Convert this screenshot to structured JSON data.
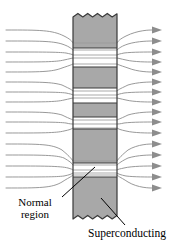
{
  "figure": {
    "canvas": {
      "width": 186,
      "height": 244,
      "background": "#ffffff"
    },
    "bar": {
      "name": "superconducting-bar",
      "x": 73,
      "width": 44,
      "top": 13,
      "bottom": 219,
      "fill_color": "#a8a8a8",
      "stroke_color": "#3a3a3a",
      "stroke_width": 1.1,
      "top_edge_style": "zigzag-torn",
      "bottom_edge_style": "zigzag-torn",
      "zigzag_teeth": 9,
      "zigzag_amplitude": 4
    },
    "superconducting_bands": [
      {
        "name": "band-1",
        "top": 13,
        "bottom": 48,
        "state": "superconducting"
      },
      {
        "name": "band-2",
        "top": 67,
        "bottom": 88,
        "state": "superconducting"
      },
      {
        "name": "band-3",
        "top": 103,
        "bottom": 117,
        "state": "superconducting"
      },
      {
        "name": "band-4",
        "top": 129,
        "bottom": 163,
        "state": "superconducting"
      },
      {
        "name": "band-5",
        "top": 177,
        "bottom": 219,
        "state": "superconducting"
      }
    ],
    "normal_regions": [
      {
        "name": "normal-gap-1",
        "top": 48,
        "bottom": 67,
        "state": "normal"
      },
      {
        "name": "normal-gap-2",
        "top": 88,
        "bottom": 103,
        "state": "normal"
      },
      {
        "name": "normal-gap-3",
        "top": 117,
        "bottom": 129,
        "state": "normal"
      },
      {
        "name": "normal-gap-4",
        "top": 163,
        "bottom": 177,
        "state": "normal"
      }
    ],
    "field_lines": {
      "name": "magnetic-field-lines",
      "count": 16,
      "stroke_color": "#8a8a8a",
      "stroke_width": 0.9,
      "direction": "left-to-right",
      "left_x": 6,
      "right_x": 152,
      "y_positions": [
        30,
        41,
        52,
        62,
        72,
        82,
        92,
        102,
        112,
        122,
        133,
        144,
        155,
        166,
        177,
        188
      ],
      "focus_y": [
        57,
        95,
        123,
        170
      ],
      "description": "Flux lines pass through the normal (white) regions and are expelled from the superconducting (grey) bands"
    },
    "arrowheads": {
      "name": "field-arrowheads",
      "count": 16,
      "x": 156,
      "size": 6,
      "fill_color": "#8a8a8a",
      "shape": "right-triangle"
    },
    "callouts": [
      {
        "name": "callout-normal-region",
        "label_lines": [
          "Normal",
          "region"
        ],
        "leader": {
          "x1": 63,
          "y1": 196,
          "x2": 94,
          "y2": 168
        },
        "stroke_color": "#000000"
      },
      {
        "name": "callout-superconducting",
        "label_lines": [
          "Superconducting"
        ],
        "leader": {
          "x1": 124,
          "y1": 226,
          "x2": 101,
          "y2": 198
        },
        "stroke_color": "#000000"
      }
    ]
  },
  "labels": {
    "normal_line1": "Normal",
    "normal_line2": "region",
    "superconducting": "Superconducting"
  }
}
